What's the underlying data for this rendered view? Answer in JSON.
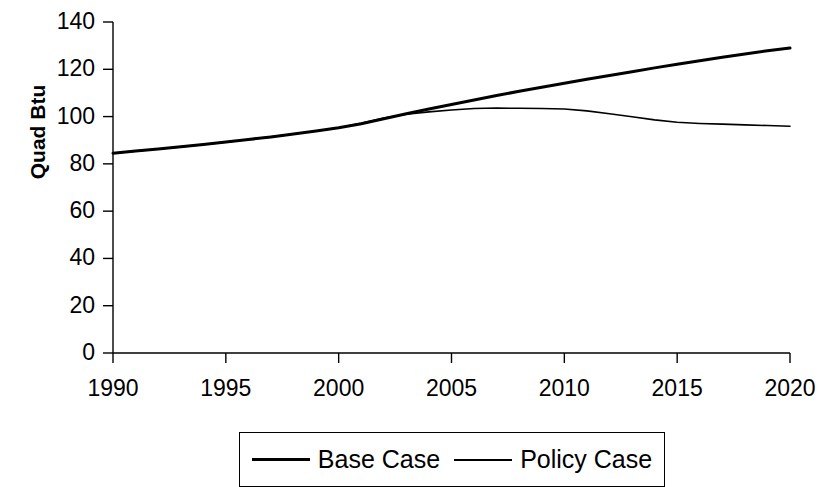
{
  "chart_data": {
    "type": "line",
    "title": "",
    "xlabel": "",
    "ylabel": "Quad Btu",
    "xlim": [
      1990,
      2020
    ],
    "ylim": [
      0,
      140
    ],
    "xticks": [
      1990,
      1995,
      2000,
      2005,
      2010,
      2015,
      2020
    ],
    "yticks": [
      0,
      20,
      40,
      60,
      80,
      100,
      120,
      140
    ],
    "xtick_labels": [
      "1990",
      "1995",
      "2000",
      "2005",
      "2010",
      "2015",
      "2020"
    ],
    "ytick_labels": [
      "0",
      "20",
      "40",
      "60",
      "80",
      "100",
      "120",
      "140"
    ],
    "grid": false,
    "legend_position": "bottom-center",
    "x": [
      1990,
      1991,
      1992,
      1993,
      1994,
      1995,
      1996,
      1997,
      1998,
      1999,
      2000,
      2001,
      2002,
      2003,
      2004,
      2005,
      2006,
      2007,
      2008,
      2009,
      2010,
      2011,
      2012,
      2013,
      2014,
      2015,
      2016,
      2017,
      2018,
      2019,
      2020
    ],
    "series": [
      {
        "name": "Base Case",
        "color": "#000000",
        "line_width": 3,
        "values": [
          84.5,
          85.4,
          86.3,
          87.2,
          88.2,
          89.2,
          90.3,
          91.4,
          92.6,
          93.9,
          95.3,
          97.0,
          99.1,
          101.2,
          103.2,
          105.1,
          107.0,
          108.9,
          110.7,
          112.4,
          114.1,
          115.8,
          117.4,
          119.0,
          120.6,
          122.1,
          123.6,
          125.1,
          126.5,
          127.8,
          129.0
        ]
      },
      {
        "name": "Policy Case",
        "color": "#000000",
        "line_width": 1.6,
        "values": [
          84.5,
          85.4,
          86.3,
          87.2,
          88.2,
          89.2,
          90.3,
          91.4,
          92.6,
          93.9,
          95.3,
          97.2,
          99.4,
          101.0,
          102.0,
          102.8,
          103.4,
          103.6,
          103.5,
          103.4,
          103.2,
          102.4,
          101.2,
          99.9,
          98.6,
          97.6,
          97.1,
          96.8,
          96.5,
          96.2,
          95.9
        ]
      }
    ]
  },
  "legend": {
    "entries": [
      {
        "label": "Base Case",
        "swatch": "thick-line-swatch"
      },
      {
        "label": "Policy Case",
        "swatch": "thin-line-swatch"
      }
    ]
  },
  "axes": {
    "y_title": "Quad Btu"
  }
}
